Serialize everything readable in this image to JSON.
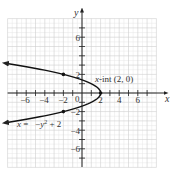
{
  "chart_data": {
    "type": "line",
    "title": "",
    "xlabel": "x",
    "ylabel": "y",
    "xlim": [
      -8,
      8
    ],
    "ylim": [
      -8,
      8
    ],
    "grid": true,
    "x_ticks": [
      -6,
      -4,
      -2,
      2,
      4,
      6
    ],
    "y_ticks": [
      6,
      2,
      -2,
      -4,
      -6
    ],
    "x_tick_labels": [
      "−6",
      "−4",
      "−2",
      "2",
      "4",
      "6"
    ],
    "y_tick_labels": [
      "6",
      "2",
      "−2",
      "−4",
      "−6"
    ],
    "origin_label": "0",
    "series": [
      {
        "name": "x = −y² + 2",
        "equation": "x = -y^2 + 2",
        "y_range": [
          -3.2,
          3.2
        ],
        "points": [
          {
            "x": -8.24,
            "y": -3.2
          },
          {
            "x": -2,
            "y": -2
          },
          {
            "x": 1,
            "y": -1
          },
          {
            "x": 2,
            "y": 0
          },
          {
            "x": 1,
            "y": 1
          },
          {
            "x": -2,
            "y": 2
          },
          {
            "x": -8.24,
            "y": 3.2
          }
        ],
        "marked_points": [
          {
            "x": -2,
            "y": 2
          },
          {
            "x": 2,
            "y": 0
          },
          {
            "x": -2,
            "y": -2
          }
        ]
      }
    ],
    "annotations": [
      {
        "text": "x-int (2, 0)",
        "x": 2,
        "y": 0
      },
      {
        "text": "x = −y² + 2",
        "x": -7.5,
        "y": -3.3
      }
    ]
  },
  "labels": {
    "x_axis": "x",
    "y_axis": "y",
    "origin": "0",
    "xint_prefix": "x",
    "xint_rest": "-int (2, 0)",
    "eq_x": "x",
    "eq_mid": " =   −",
    "eq_y": "y",
    "eq_exp": "2",
    "eq_end": " + 2",
    "x_ticks": [
      "−6",
      "−4",
      "−2",
      "2",
      "4",
      "6"
    ],
    "y_ticks": [
      "6",
      "2",
      "−2",
      "−4",
      "−6"
    ]
  }
}
